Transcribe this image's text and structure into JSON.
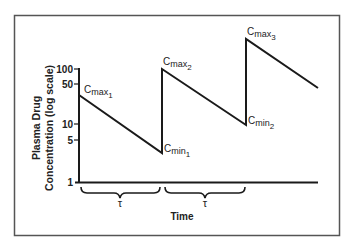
{
  "figure": {
    "ylabel_line1": "Plasma Drug",
    "ylabel_line2": "Concentration (log scale)",
    "xlabel": "Time",
    "tau_label": "τ",
    "y_ticks": [
      "100",
      "50",
      "10",
      "5",
      "1"
    ],
    "annotations": {
      "cmax1": {
        "base": "C",
        "sub": "max",
        "index": "1"
      },
      "cmax2": {
        "base": "C",
        "sub": "max",
        "index": "2"
      },
      "cmax3": {
        "base": "C",
        "sub": "max",
        "index": "3"
      },
      "cmin1": {
        "base": "C",
        "sub": "min",
        "index": "1"
      },
      "cmin2": {
        "base": "C",
        "sub": "min",
        "index": "2"
      }
    },
    "colors": {
      "line": "#1a1a1a",
      "frame": "#555555",
      "background": "#ffffff"
    }
  }
}
